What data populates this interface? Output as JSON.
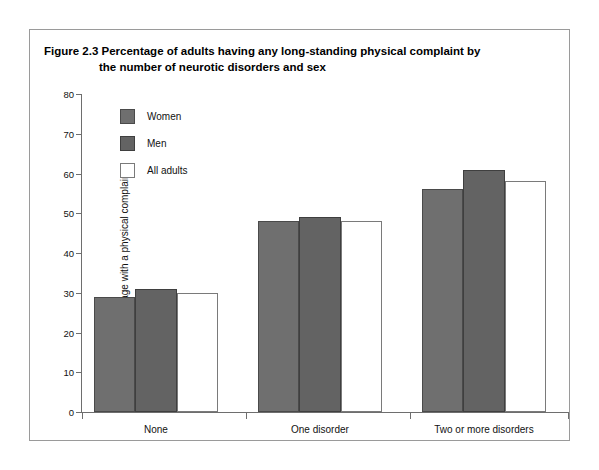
{
  "figure": {
    "label": "Figure 2.3",
    "title_line1": "Percentage of adults having any long-standing physical complaint by",
    "title_line2": "the number of neurotic disorders and sex"
  },
  "colors": {
    "women": "#6f6f6f",
    "men": "#636363",
    "all_adults": "#ffffff",
    "axis": "#6e6e6e",
    "frame": "#9a9a9a",
    "text": "#111111"
  },
  "chart_data": {
    "type": "bar",
    "title": "Figure 2.3 Percentage of adults having any long-standing physical complaint by the number of neurotic disorders and sex",
    "xlabel": "",
    "ylabel": "Percentage with a physical complaint",
    "ylim": [
      0,
      80
    ],
    "ytick_step": 10,
    "yticks": [
      0,
      10,
      20,
      30,
      40,
      50,
      60,
      70,
      80
    ],
    "ytick_labels": [
      "0",
      "10",
      "20",
      "30",
      "40",
      "50",
      "60",
      "70",
      "80"
    ],
    "grid": false,
    "legend_position": "upper left inside plot",
    "categories": [
      "None",
      "One disorder",
      "Two or more disorders"
    ],
    "series": [
      {
        "name": "Women",
        "values": [
          29,
          48,
          56
        ]
      },
      {
        "name": "Men",
        "values": [
          31,
          49,
          61
        ]
      },
      {
        "name": "All adults",
        "values": [
          30,
          48,
          58
        ]
      }
    ]
  },
  "legend": [
    {
      "label": "Women",
      "swatch": "women"
    },
    {
      "label": "Men",
      "swatch": "men"
    },
    {
      "label": "All adults",
      "swatch": "all"
    }
  ]
}
